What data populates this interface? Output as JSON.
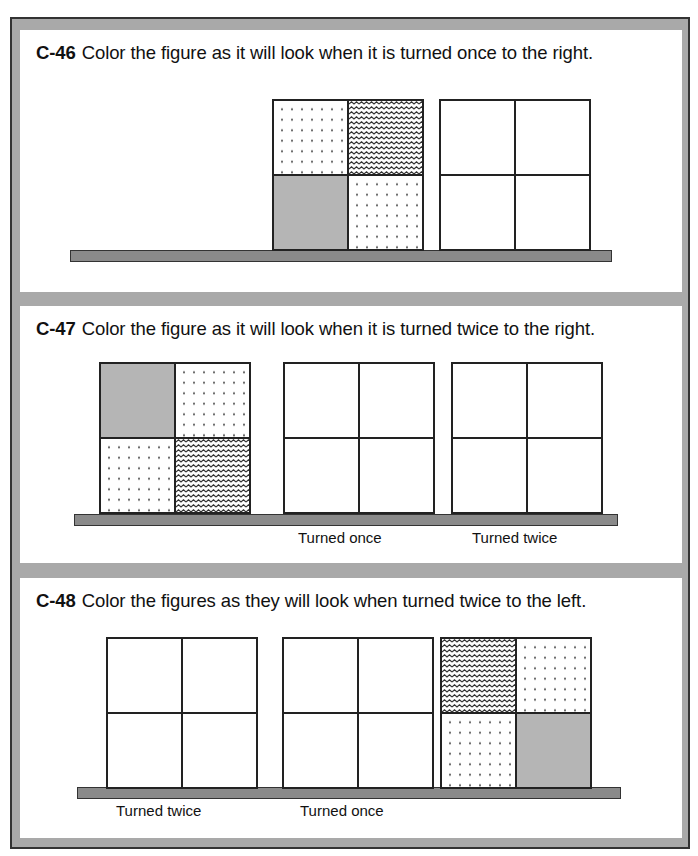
{
  "problems": [
    {
      "id": "C-46",
      "instruction": "Color the figure as it will look when it is turned once to the right.",
      "figures": [
        {
          "role": "given",
          "cells": [
            "dots",
            "wave",
            "gray",
            "dots"
          ]
        },
        {
          "role": "answer",
          "label": "",
          "cells": [
            "blank",
            "blank",
            "blank",
            "blank"
          ]
        }
      ]
    },
    {
      "id": "C-47",
      "instruction": "Color the figure as it will look when it is turned twice to the right.",
      "figures": [
        {
          "role": "given",
          "cells": [
            "gray",
            "dots",
            "dots",
            "wave"
          ]
        },
        {
          "role": "answer",
          "label": "Turned once",
          "cells": [
            "blank",
            "blank",
            "blank",
            "blank"
          ]
        },
        {
          "role": "answer",
          "label": "Turned twice",
          "cells": [
            "blank",
            "blank",
            "blank",
            "blank"
          ]
        }
      ]
    },
    {
      "id": "C-48",
      "instruction": "Color the figures as they will look when turned twice to the left.",
      "figures": [
        {
          "role": "answer",
          "label": "Turned twice",
          "cells": [
            "blank",
            "blank",
            "blank",
            "blank"
          ]
        },
        {
          "role": "answer",
          "label": "Turned once",
          "cells": [
            "blank",
            "blank",
            "blank",
            "blank"
          ]
        },
        {
          "role": "given",
          "cells": [
            "wave",
            "dots",
            "dots",
            "gray"
          ]
        }
      ]
    }
  ],
  "colors": {
    "frame": "#a9a9a9",
    "shelf": "#8a8a8a",
    "gray_cell": "#b5b5b5",
    "border": "#222222"
  }
}
